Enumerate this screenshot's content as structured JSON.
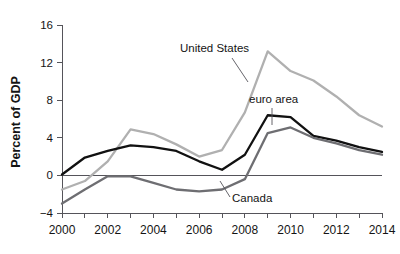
{
  "chart_data": {
    "type": "line",
    "title": "",
    "subtitle": "",
    "xlabel": "",
    "ylabel": "Percent of GDP",
    "xlim": [
      2000,
      2014
    ],
    "ylim": [
      -4,
      16
    ],
    "yticks": [
      -4,
      0,
      4,
      8,
      12,
      16
    ],
    "ytick_labels": [
      "−4",
      "0",
      "4",
      "8",
      "12",
      "16"
    ],
    "xticks": [
      2000,
      2001,
      2002,
      2003,
      2004,
      2005,
      2006,
      2007,
      2008,
      2009,
      2010,
      2011,
      2012,
      2013,
      2014
    ],
    "xtick_labels_major": [
      "2000",
      "2002",
      "2004",
      "2006",
      "2008",
      "2010",
      "2012",
      "2014"
    ],
    "xticks_major": [
      2000,
      2002,
      2004,
      2006,
      2008,
      2010,
      2012,
      2014
    ],
    "grid": false,
    "legend": "inline-annotations",
    "zero_reference_line": true,
    "x": [
      2000,
      2001,
      2002,
      2003,
      2004,
      2005,
      2006,
      2007,
      2008,
      2009,
      2010,
      2011,
      2012,
      2013,
      2014
    ],
    "series": [
      {
        "name": "United States",
        "color": "#b0b0b0",
        "stroke_width": 2.3,
        "values": [
          -1.5,
          -0.6,
          1.5,
          4.9,
          4.4,
          3.3,
          2.0,
          2.7,
          6.7,
          13.2,
          11.1,
          10.1,
          8.4,
          6.4,
          5.2
        ]
      },
      {
        "name": "euro area",
        "color": "#111111",
        "stroke_width": 2.3,
        "values": [
          0.1,
          1.9,
          2.6,
          3.2,
          3.0,
          2.6,
          1.5,
          0.6,
          2.2,
          6.4,
          6.2,
          4.2,
          3.7,
          3.0,
          2.5
        ]
      },
      {
        "name": "Canada",
        "color": "#6e6e72",
        "stroke_width": 2.3,
        "values": [
          -3.0,
          -1.5,
          -0.1,
          -0.1,
          -0.8,
          -1.5,
          -1.7,
          -1.5,
          -0.4,
          4.5,
          5.1,
          4.0,
          3.4,
          2.7,
          2.2
        ]
      }
    ],
    "annotations": [
      {
        "name": "United States",
        "label": "United States",
        "label_x": 180,
        "label_y": 52,
        "leader": "M 232 58 L 248 82"
      },
      {
        "name": "euro area",
        "label": "euro area",
        "label_x": 249,
        "label_y": 103,
        "leader": "M 272 108 L 272 125"
      },
      {
        "name": "Canada",
        "label": "Canada",
        "label_x": 232,
        "label_y": 202,
        "leader": "M 230 197 L 220 181"
      }
    ]
  },
  "axes": {
    "y_title": "Percent of GDP"
  }
}
